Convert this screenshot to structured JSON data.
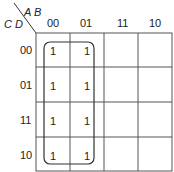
{
  "kmap": {
    "row_vars": "C D",
    "col_vars": "A B",
    "col_headers": [
      "00",
      "01",
      "11",
      "10"
    ],
    "row_headers": [
      "00",
      "01",
      "11",
      "10"
    ],
    "cells": [
      [
        "1",
        "1",
        "",
        ""
      ],
      [
        "1",
        "1",
        "",
        ""
      ],
      [
        "1",
        "1",
        "",
        ""
      ],
      [
        "1",
        "1",
        "",
        ""
      ]
    ],
    "group": {
      "cols": [
        "00",
        "01"
      ],
      "rows": [
        "00",
        "01",
        "11",
        "10"
      ]
    }
  }
}
